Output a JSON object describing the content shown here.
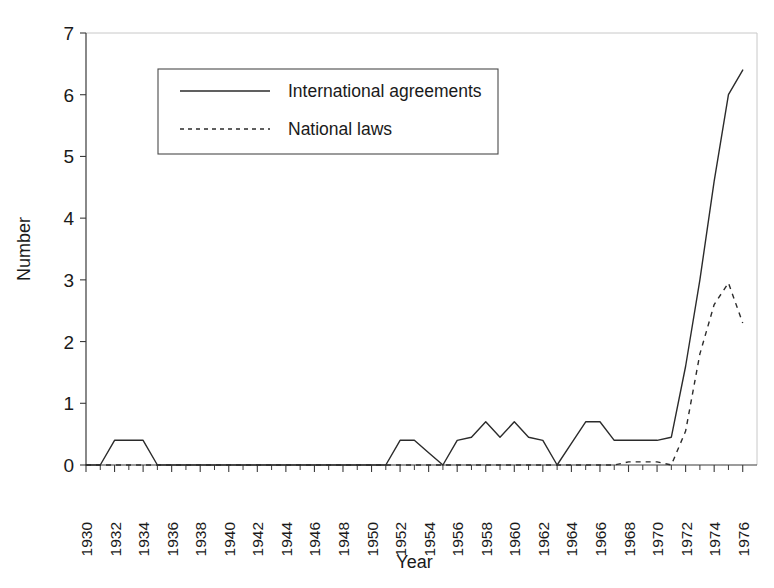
{
  "chart_data": {
    "type": "line",
    "title": "",
    "xlabel": "Year",
    "ylabel": "Number",
    "xlim": [
      1930,
      1977
    ],
    "ylim": [
      0,
      7
    ],
    "grid": false,
    "legend_position": "upper-left-inside",
    "x_tick_labels": [
      "1930",
      "1932",
      "1934",
      "1936",
      "1938",
      "1940",
      "1942",
      "1944",
      "1946",
      "1948",
      "1950",
      "1952",
      "1954",
      "1956",
      "1958",
      "1960",
      "1962",
      "1964",
      "1966",
      "1968",
      "1970",
      "1972",
      "1974",
      "1976"
    ],
    "x_tick_label_rotation": -90,
    "x_tick_step_minor": 1,
    "y_tick_labels": [
      "0",
      "1",
      "2",
      "3",
      "4",
      "5",
      "6",
      "7"
    ],
    "x": [
      1930,
      1931,
      1932,
      1933,
      1934,
      1935,
      1936,
      1937,
      1938,
      1939,
      1940,
      1941,
      1942,
      1943,
      1944,
      1945,
      1946,
      1947,
      1948,
      1949,
      1950,
      1951,
      1952,
      1953,
      1954,
      1955,
      1956,
      1957,
      1958,
      1959,
      1960,
      1961,
      1962,
      1963,
      1964,
      1965,
      1966,
      1967,
      1968,
      1969,
      1970,
      1971,
      1972,
      1973,
      1974,
      1975,
      1976
    ],
    "series": [
      {
        "name": "International agreements",
        "style": "solid",
        "values": [
          0,
          0,
          0.4,
          0.4,
          0.4,
          0,
          0,
          0,
          0,
          0,
          0,
          0,
          0,
          0,
          0,
          0,
          0,
          0,
          0,
          0,
          0,
          0,
          0.4,
          0.4,
          0.2,
          0,
          0.4,
          0.45,
          0.7,
          0.45,
          0.7,
          0.45,
          0.4,
          0,
          0.35,
          0.7,
          0.7,
          0.4,
          0.4,
          0.4,
          0.4,
          0.45,
          1.6,
          3.0,
          4.6,
          6.0,
          6.4
        ]
      },
      {
        "name": "National laws",
        "style": "dashed",
        "values": [
          0,
          0,
          0,
          0,
          0,
          0,
          0,
          0,
          0,
          0,
          0,
          0,
          0,
          0,
          0,
          0,
          0,
          0,
          0,
          0,
          0,
          0,
          0,
          0,
          0,
          0,
          0,
          0,
          0,
          0,
          0,
          0,
          0,
          0,
          0,
          0,
          0,
          0,
          0.05,
          0.05,
          0.05,
          0,
          0.55,
          1.8,
          2.6,
          2.95,
          2.3
        ]
      }
    ]
  },
  "legend": {
    "entries": [
      {
        "label": "International agreements",
        "style": "solid"
      },
      {
        "label": "National laws",
        "style": "dashed"
      }
    ]
  },
  "axes": {
    "y_title": "Number",
    "x_title": "Year"
  }
}
